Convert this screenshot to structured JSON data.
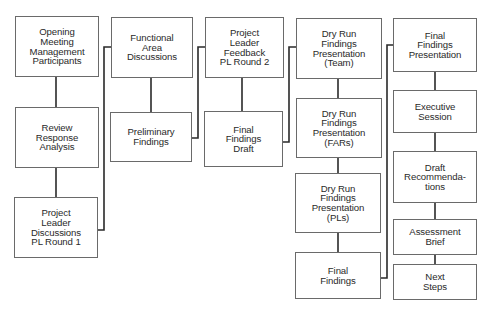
{
  "diagram": {
    "type": "process-flow",
    "columns": [
      {
        "id": "col1",
        "steps": [
          {
            "id": "opening",
            "label": "Opening\nMeeting\nManagement\nParticipants",
            "x": 15,
            "y": 16,
            "w": 84,
            "h": 61
          },
          {
            "id": "review",
            "label": "Review\nResponse\nAnalysis",
            "x": 15,
            "y": 107,
            "w": 84,
            "h": 61
          },
          {
            "id": "pl1",
            "label": "Project\nLeader\nDiscussions\nPL Round 1",
            "x": 14,
            "y": 197,
            "w": 84,
            "h": 61
          }
        ]
      },
      {
        "id": "col2",
        "steps": [
          {
            "id": "functional",
            "label": "Functional\nArea\nDiscussions",
            "x": 111,
            "y": 17,
            "w": 82,
            "h": 61
          },
          {
            "id": "preliminary",
            "label": "Preliminary\nFindings",
            "x": 110,
            "y": 112,
            "w": 82,
            "h": 50
          }
        ]
      },
      {
        "id": "col3",
        "steps": [
          {
            "id": "pl2",
            "label": "Project\nLeader\nFeedback\nPL Round 2",
            "x": 205,
            "y": 17,
            "w": 79,
            "h": 61
          },
          {
            "id": "draft",
            "label": "Final\nFindings\nDraft",
            "x": 204,
            "y": 111,
            "w": 79,
            "h": 56
          }
        ]
      },
      {
        "id": "col4",
        "steps": [
          {
            "id": "dry-team",
            "label": "Dry Run\nFindings\nPresentation\n(Team)",
            "x": 296,
            "y": 18,
            "w": 86,
            "h": 61
          },
          {
            "id": "dry-fars",
            "label": "Dry Run\nFindings\nPresentation\n(FARs)",
            "x": 296,
            "y": 98,
            "w": 86,
            "h": 60
          },
          {
            "id": "dry-pls",
            "label": "Dry Run\nFindings\nPresentation\n(PLs)",
            "x": 295,
            "y": 173,
            "w": 86,
            "h": 60
          },
          {
            "id": "final-findings",
            "label": "Final\nFindings",
            "x": 295,
            "y": 252,
            "w": 86,
            "h": 47
          }
        ]
      },
      {
        "id": "col5",
        "steps": [
          {
            "id": "final-pres",
            "label": "Final\nFindings\nPresentation",
            "x": 393,
            "y": 18,
            "w": 84,
            "h": 54
          },
          {
            "id": "exec",
            "label": "Executive\nSession",
            "x": 393,
            "y": 90,
            "w": 84,
            "h": 43
          },
          {
            "id": "draft-rec",
            "label": "Draft\nRecommenda-\ntions",
            "x": 393,
            "y": 151,
            "w": 84,
            "h": 52
          },
          {
            "id": "brief",
            "label": "Assessment\nBrief",
            "x": 393,
            "y": 219,
            "w": 84,
            "h": 36
          },
          {
            "id": "next",
            "label": "Next\nSteps",
            "x": 393,
            "y": 264,
            "w": 84,
            "h": 36
          }
        ]
      }
    ],
    "vertical_links": [
      {
        "x": 56,
        "y1": 77,
        "y2": 107
      },
      {
        "x": 56,
        "y1": 168,
        "y2": 197
      },
      {
        "x": 151,
        "y1": 78,
        "y2": 112
      },
      {
        "x": 242,
        "y1": 78,
        "y2": 111
      },
      {
        "x": 338,
        "y1": 79,
        "y2": 98
      },
      {
        "x": 338,
        "y1": 158,
        "y2": 173
      },
      {
        "x": 338,
        "y1": 233,
        "y2": 252
      },
      {
        "x": 435,
        "y1": 72,
        "y2": 90
      },
      {
        "x": 435,
        "y1": 133,
        "y2": 151
      },
      {
        "x": 435,
        "y1": 203,
        "y2": 219
      },
      {
        "x": 435,
        "y1": 255,
        "y2": 264
      }
    ],
    "elbow_links": [
      {
        "from": "pl1",
        "to": "functional",
        "points": "98,230 104,230 104,47 111,47"
      },
      {
        "from": "preliminary",
        "to": "pl2",
        "points": "192,138 198,138 198,47 205,47"
      },
      {
        "from": "draft",
        "to": "dry-team",
        "points": "283,142 289,142 289,47 296,47"
      },
      {
        "from": "final-findings",
        "to": "final-pres",
        "points": "381,278 387,278 387,45 393,45"
      }
    ],
    "line_color": "#2a2a2a",
    "box_border_color": "#6a6a6a"
  }
}
